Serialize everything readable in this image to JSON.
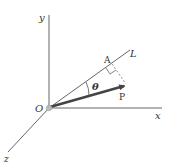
{
  "labels": {
    "y_axis": "y",
    "x_axis": "x",
    "z_axis": "z",
    "origin": "O",
    "line": "L",
    "point_a": "A",
    "point_p": "P",
    "angle": "θ"
  },
  "colors": {
    "axis": "#666666",
    "vector": "#444444",
    "dashed": "#777777",
    "origin_dot": "#bbbbbb"
  }
}
